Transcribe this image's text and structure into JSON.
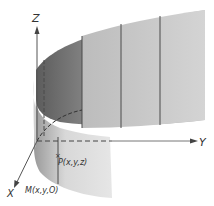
{
  "figure": {
    "axes": {
      "x_label": "X",
      "y_label": "Y",
      "z_label": "Z"
    },
    "points": {
      "p_label": "P(x,y,z)",
      "m_label": "M(x,y,O)"
    },
    "colors": {
      "surface_light": "#d6d6d6",
      "surface_mid": "#bdbdbd",
      "surface_dark": "#6e6e6e",
      "axis": "#555555",
      "ruling": "#4a4a4a"
    }
  }
}
